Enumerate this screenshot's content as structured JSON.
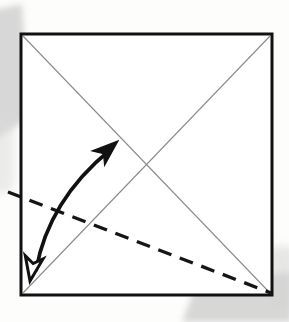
{
  "figure": {
    "title": "Origami fold step diagram",
    "canvas": {
      "width": 289,
      "height": 322
    },
    "background_color": "#fdfdfc"
  },
  "paper": {
    "name": "square-sheet",
    "x": 21,
    "y": 34,
    "width": 251,
    "height": 261,
    "stroke_color": "#111111",
    "stroke_width": 3,
    "fill_color": "#ffffff"
  },
  "creases": {
    "label": "existing diagonal creases",
    "stroke_color": "#8b8b8b",
    "stroke_width": 1.1,
    "lines": [
      {
        "name": "diagonal-crease-tl-br",
        "x1": 23,
        "y1": 36,
        "x2": 270,
        "y2": 293
      },
      {
        "name": "diagonal-crease-tr-bl",
        "x1": 270,
        "y1": 36,
        "x2": 23,
        "y2": 293
      }
    ],
    "intersection": {
      "x": 147,
      "y": 164
    }
  },
  "fold_line": {
    "name": "dashed-fold-line",
    "label": "valley fold line (dashed)",
    "x1": 8,
    "y1": 192,
    "x2": 271,
    "y2": 293,
    "stroke_color": "#151515",
    "stroke_width": 3.4,
    "dash_length": 14,
    "gap_length": 9
  },
  "motion_arrow": {
    "name": "fold-and-unfold-arrow",
    "label": "curved double-headed fold/unfold arrow",
    "stroke_color": "#111111",
    "stroke_width": 3.6,
    "path": "M 36 270 C 44 226, 66 186, 110 150",
    "head_filled": {
      "name": "arrowhead-solid-top",
      "fill": "#111111",
      "tip_x": 118,
      "tip_y": 141,
      "angle_deg": -41,
      "style": "solid"
    },
    "head_hollow": {
      "name": "arrowhead-hollow-bottom",
      "fill": "#ffffff",
      "stroke": "#111111",
      "tip_x": 30,
      "tip_y": 281,
      "angle_deg": 100,
      "style": "outline"
    }
  },
  "scan_shadows": [
    {
      "name": "shadow-upper-left",
      "color": "#c9c9c9",
      "opacity": 0.72,
      "x": -14,
      "y": 10,
      "width": 36,
      "height": 128,
      "skew_deg": -6,
      "blur": 3
    },
    {
      "name": "shadow-left-edge-lower",
      "color": "#dadada",
      "opacity": 0.5,
      "x": -10,
      "y": 120,
      "width": 22,
      "height": 70,
      "skew_deg": 0,
      "blur": 4
    },
    {
      "name": "shadow-bottom-right",
      "color": "#c7c7c7",
      "opacity": 0.7,
      "x": 178,
      "y": 280,
      "width": 112,
      "height": 44,
      "skew_deg": 0,
      "blur": 3
    },
    {
      "name": "shadow-right-edge",
      "color": "#d4d4d4",
      "opacity": 0.55,
      "x": 268,
      "y": 248,
      "width": 24,
      "height": 58,
      "skew_deg": 0,
      "blur": 4
    }
  ]
}
